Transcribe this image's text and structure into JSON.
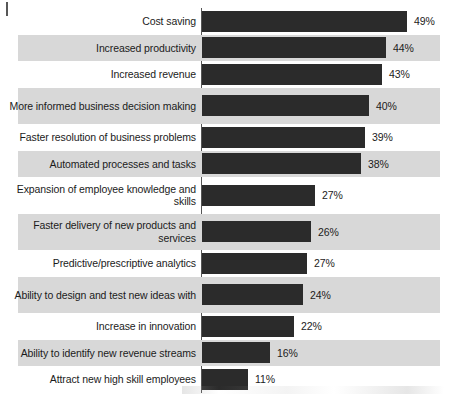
{
  "chart_data": {
    "type": "bar",
    "orientation": "horizontal",
    "title": "",
    "subtitle": "",
    "xlabel": "",
    "ylabel": "",
    "grid": false,
    "legend": null,
    "xlim": [
      0,
      49
    ],
    "value_suffix": "%",
    "categories": [
      "Cost saving",
      "Increased productivity",
      "Increased revenue",
      "More informed business decision making",
      "Faster resolution of business problems",
      "Automated processes and tasks",
      "Expansion of employee knowledge and skills",
      "Faster delivery of new products and services",
      "Predictive/prescriptive analytics",
      "Ability to design and test new ideas with",
      "Increase in innovation",
      "Ability to identify new revenue streams",
      "Attract new high skill employees"
    ],
    "values": [
      49,
      44,
      43,
      40,
      39,
      38,
      27,
      26,
      27,
      24,
      22,
      16,
      11
    ],
    "value_labels": [
      "49%",
      "44%",
      "43%",
      "40%",
      "39%",
      "38%",
      "27%",
      "26%",
      "27%",
      "24%",
      "22%",
      "16%",
      "11%"
    ],
    "bar_pixel_widths": [
      205,
      184,
      180,
      167,
      163,
      159,
      113,
      109,
      105,
      101,
      92,
      68,
      46
    ],
    "colors": {
      "bar": "#2b2b2b",
      "band": "#d8d8d8",
      "text": "#1b1b1b",
      "axis": "#555555",
      "background": "#ffffff"
    }
  },
  "rows": [
    {
      "label": "Cost saving",
      "value_label": "49%",
      "lines": 1
    },
    {
      "label": "Increased productivity",
      "value_label": "44%",
      "lines": 1
    },
    {
      "label": "Increased revenue",
      "value_label": "43%",
      "lines": 1
    },
    {
      "label": "More informed business decision making",
      "value_label": "40%",
      "lines": 2
    },
    {
      "label": "Faster resolution of business problems",
      "value_label": "39%",
      "lines": 1
    },
    {
      "label": "Automated processes and tasks",
      "value_label": "38%",
      "lines": 1
    },
    {
      "label": "Expansion of employee knowledge and skills",
      "value_label": "27%",
      "lines": 2
    },
    {
      "label": "Faster delivery of new products and services",
      "value_label": "26%",
      "lines": 2
    },
    {
      "label": "Predictive/prescriptive analytics",
      "value_label": "27%",
      "lines": 1
    },
    {
      "label": "Ability to design and test new ideas with",
      "value_label": "24%",
      "lines": 2
    },
    {
      "label": "Increase in innovation",
      "value_label": "22%",
      "lines": 1
    },
    {
      "label": "Ability to identify new revenue streams",
      "value_label": "16%",
      "lines": 1
    },
    {
      "label": "Attract new high skill employees",
      "value_label": "11%",
      "lines": 1
    }
  ]
}
